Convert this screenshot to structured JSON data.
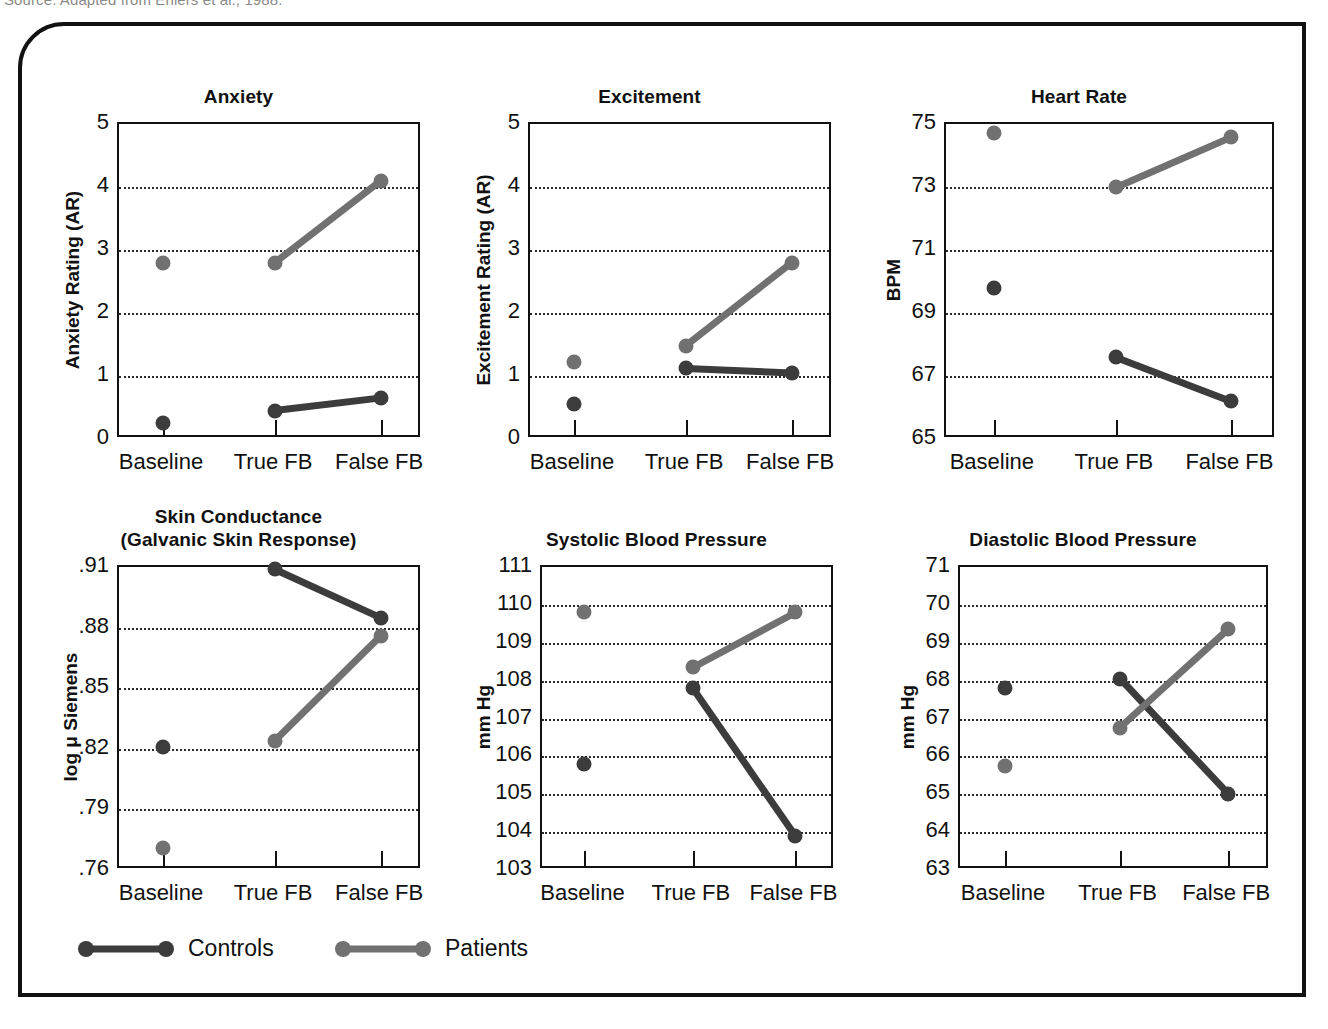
{
  "source_note": "Source: Adapted from Ehlers et al., 1988.",
  "legend": {
    "entries": [
      {
        "label": "Controls",
        "color": "#3c3c3c"
      },
      {
        "label": "Patients",
        "color": "#717171"
      }
    ]
  },
  "colors": {
    "controls": "#3c3c3c",
    "patients": "#717171",
    "axis": "#111111",
    "grid": "#2a2a2a",
    "frame": "#111111",
    "background": "#ffffff"
  },
  "categories": [
    "Baseline",
    "True FB",
    "False FB"
  ],
  "chart_data": [
    {
      "type": "line",
      "title": "Anxiety",
      "xlabel": "",
      "ylabel": "Anxiety Rating (AR)",
      "categories": [
        "Baseline",
        "True FB",
        "False FB"
      ],
      "ylim": [
        0,
        5
      ],
      "yticks": [
        0,
        1,
        2,
        3,
        4,
        5
      ],
      "ytick_labels": [
        "0",
        "1",
        "2",
        "3",
        "4",
        "5"
      ],
      "gridlines": [
        1,
        2,
        3,
        4
      ],
      "grid": true,
      "legend_position": "below-figure",
      "series": [
        {
          "name": "Controls",
          "values": [
            0.25,
            0.45,
            0.65
          ],
          "connect_from": 1
        },
        {
          "name": "Patients",
          "values": [
            2.8,
            2.8,
            4.1
          ],
          "connect_from": 1
        }
      ]
    },
    {
      "type": "line",
      "title": "Excitement",
      "xlabel": "",
      "ylabel": "Excitement Rating (AR)",
      "categories": [
        "Baseline",
        "True FB",
        "False FB"
      ],
      "ylim": [
        0,
        5
      ],
      "yticks": [
        0,
        1,
        2,
        3,
        4,
        5
      ],
      "ytick_labels": [
        "0",
        "1",
        "2",
        "3",
        "4",
        "5"
      ],
      "gridlines": [
        1,
        2,
        3,
        4
      ],
      "grid": true,
      "legend_position": "below-figure",
      "series": [
        {
          "name": "Controls",
          "values": [
            0.55,
            1.12,
            1.05
          ],
          "connect_from": 1
        },
        {
          "name": "Patients",
          "values": [
            1.22,
            1.48,
            2.8
          ],
          "connect_from": 1
        }
      ]
    },
    {
      "type": "line",
      "title": "Heart Rate",
      "xlabel": "",
      "ylabel": "BPM",
      "categories": [
        "Baseline",
        "True FB",
        "False FB"
      ],
      "ylim": [
        65,
        75
      ],
      "yticks": [
        65,
        67,
        69,
        71,
        73,
        75
      ],
      "ytick_labels": [
        "65",
        "67",
        "69",
        "71",
        "73",
        "75"
      ],
      "gridlines": [
        67,
        69,
        71,
        73
      ],
      "grid": true,
      "legend_position": "below-figure",
      "series": [
        {
          "name": "Controls",
          "values": [
            69.8,
            67.6,
            66.2
          ],
          "connect_from": 1
        },
        {
          "name": "Patients",
          "values": [
            74.7,
            73.0,
            74.6
          ],
          "connect_from": 1
        }
      ]
    },
    {
      "type": "line",
      "title": "Skin Conductance\n(Galvanic Skin Response)",
      "title_lines": [
        "Skin Conductance",
        "(Galvanic Skin Response)"
      ],
      "xlabel": "",
      "ylabel": "log μ Siemens",
      "categories": [
        "Baseline",
        "True FB",
        "False FB"
      ],
      "ylim": [
        0.76,
        0.91
      ],
      "yticks": [
        0.76,
        0.79,
        0.82,
        0.85,
        0.88,
        0.91
      ],
      "ytick_labels": [
        ".76",
        ".79",
        ".82",
        ".85",
        ".88",
        ".91"
      ],
      "gridlines": [
        0.79,
        0.82,
        0.85,
        0.88
      ],
      "grid": true,
      "legend_position": "below-figure",
      "series": [
        {
          "name": "Controls",
          "values": [
            0.821,
            0.909,
            0.885
          ],
          "connect_from": 1
        },
        {
          "name": "Patients",
          "values": [
            0.771,
            0.824,
            0.876
          ],
          "connect_from": 1
        }
      ]
    },
    {
      "type": "line",
      "title": "Systolic Blood Pressure",
      "xlabel": "",
      "ylabel": "mm Hg",
      "categories": [
        "Baseline",
        "True FB",
        "False FB"
      ],
      "ylim": [
        103,
        111
      ],
      "yticks": [
        103,
        104,
        105,
        106,
        107,
        108,
        109,
        110,
        111
      ],
      "ytick_labels": [
        "103",
        "104",
        "105",
        "106",
        "107",
        "108",
        "109",
        "110",
        "111"
      ],
      "gridlines": [
        104,
        105,
        106,
        107,
        108,
        109,
        110
      ],
      "grid": true,
      "legend_position": "below-figure",
      "series": [
        {
          "name": "Controls",
          "values": [
            105.8,
            107.8,
            103.9
          ],
          "connect_from": 1
        },
        {
          "name": "Patients",
          "values": [
            109.8,
            108.35,
            109.8
          ],
          "connect_from": 1
        }
      ]
    },
    {
      "type": "line",
      "title": "Diastolic Blood Pressure",
      "xlabel": "",
      "ylabel": "mm Hg",
      "categories": [
        "Baseline",
        "True FB",
        "False FB"
      ],
      "ylim": [
        63,
        71
      ],
      "yticks": [
        63,
        64,
        65,
        66,
        67,
        68,
        69,
        70,
        71
      ],
      "ytick_labels": [
        "63",
        "64",
        "65",
        "66",
        "67",
        "68",
        "69",
        "70",
        "71"
      ],
      "gridlines": [
        64,
        65,
        66,
        67,
        68,
        69,
        70
      ],
      "grid": true,
      "legend_position": "below-figure",
      "series": [
        {
          "name": "Controls",
          "values": [
            67.8,
            68.05,
            65.0
          ],
          "connect_from": 1
        },
        {
          "name": "Patients",
          "values": [
            65.75,
            66.75,
            69.35
          ],
          "connect_from": 1
        }
      ]
    }
  ]
}
